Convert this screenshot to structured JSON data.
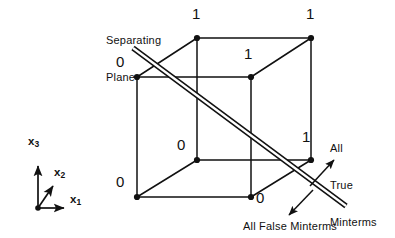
{
  "figure": {
    "title_absent": true,
    "background_color": "#ffffff",
    "ink_color": "#111111"
  },
  "axes": {
    "origin": {
      "x": 38,
      "y": 208
    },
    "items": [
      {
        "name": "x1",
        "label": "x",
        "subscript": "1",
        "label_x": 73,
        "label_y": 199,
        "tip_x": 68,
        "tip_y": 208
      },
      {
        "name": "x2",
        "label": "x",
        "subscript": "2",
        "label_x": 56,
        "label_y": 172,
        "tip_x": 52,
        "tip_y": 182
      },
      {
        "name": "x3",
        "label": "x",
        "subscript": "3",
        "label_x": 30,
        "label_y": 140,
        "tip_x": 38,
        "tip_y": 162
      }
    ]
  },
  "cube": {
    "vertices": [
      {
        "name": "back-top-left",
        "x": 137,
        "y": 77,
        "value": "0",
        "label_x": 118,
        "label_y": 62
      },
      {
        "name": "front-top-left",
        "x": 197,
        "y": 38,
        "value": "1",
        "label_x": 192,
        "label_y": 10
      },
      {
        "name": "front-top-right",
        "x": 311,
        "y": 38,
        "value": "1",
        "label_x": 306,
        "label_y": 10
      },
      {
        "name": "back-top-right",
        "x": 251,
        "y": 77,
        "value": "1",
        "label_x": 245,
        "label_y": 50
      },
      {
        "name": "back-bottom-left",
        "x": 137,
        "y": 197,
        "value": "0",
        "label_x": 118,
        "label_y": 182
      },
      {
        "name": "front-bottom-left",
        "x": 197,
        "y": 160,
        "value": "0",
        "label_x": 178,
        "label_y": 144
      },
      {
        "name": "front-bottom-right",
        "x": 311,
        "y": 160,
        "value": "1",
        "label_x": 303,
        "label_y": 135
      },
      {
        "name": "back-bottom-right",
        "x": 251,
        "y": 197,
        "value": "0",
        "label_x": 257,
        "label_y": 191
      }
    ]
  },
  "separating_plane": {
    "label_line1": "Separating",
    "label_line2": "Plane",
    "label_x": 106,
    "label_y": 11,
    "line_start": {
      "x": 133,
      "y": 48
    },
    "line_end": {
      "x": 346,
      "y": 206
    }
  },
  "annotations": [
    {
      "name": "all-true-minterms",
      "lines": [
        "All",
        "True",
        "Minterms"
      ],
      "text_x": 330,
      "text_y": 118,
      "arrow_from": {
        "x": 310,
        "y": 185
      },
      "arrow_to": {
        "x": 333,
        "y": 160
      }
    },
    {
      "name": "all-false-minterms",
      "lines": [
        "All False Minterms"
      ],
      "text_x": 244,
      "text_y": 222,
      "arrow_from": {
        "x": 312,
        "y": 191
      },
      "arrow_to": {
        "x": 288,
        "y": 214
      }
    }
  ]
}
